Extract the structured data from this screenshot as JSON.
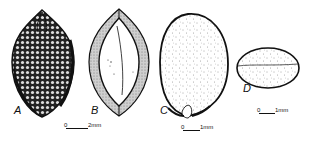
{
  "figure": {
    "panels": [
      {
        "id": "A",
        "label": "A",
        "description": "seed exterior, reticulate surface, dark shading"
      },
      {
        "id": "B",
        "label": "B",
        "description": "seed longitudinal section"
      },
      {
        "id": "C",
        "label": "C",
        "description": "embryo / kernel, stippled, with hilum at base"
      },
      {
        "id": "D",
        "label": "D",
        "description": "cross-section, ellipse with median line"
      }
    ],
    "scale_bars": [
      {
        "id": "scale-ab",
        "start": "0",
        "end": "2",
        "unit": "mm"
      },
      {
        "id": "scale-c",
        "start": "0",
        "end": "1",
        "unit": "mm"
      },
      {
        "id": "scale-d",
        "start": "0",
        "end": "1",
        "unit": "mm"
      }
    ],
    "colors": {
      "ink": "#111111",
      "background": "#ffffff",
      "stipple": "#444444"
    }
  }
}
